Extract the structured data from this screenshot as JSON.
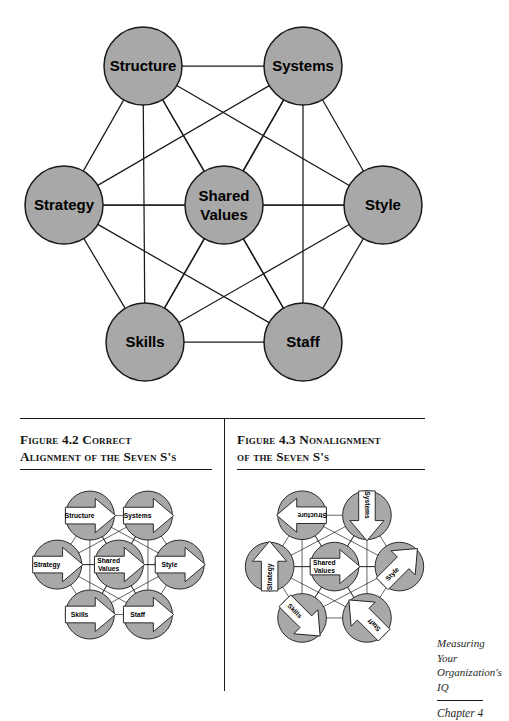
{
  "document": {
    "title": "The Seven S Framework",
    "page_background": "#ffffff"
  },
  "colors": {
    "node_fill": "#a8a8a8",
    "node_stroke": "#1a1a1a",
    "edge_stroke": "#1a1a1a",
    "arrow_fill": "#ffffff",
    "arrow_stroke": "#1a1a1a",
    "text": "#000000",
    "rule": "#1a1a1a"
  },
  "main_diagram": {
    "name": "seven-s-framework-diagram",
    "node_label_font_size": 15,
    "nodes": [
      {
        "id": "structure",
        "label": "Structure",
        "cx": 143,
        "cy": 66,
        "r": 39
      },
      {
        "id": "systems",
        "label": "Systems",
        "cx": 303,
        "cy": 66,
        "r": 39
      },
      {
        "id": "strategy",
        "label": "Strategy",
        "cx": 64,
        "cy": 205,
        "r": 39
      },
      {
        "id": "shared_values",
        "label": "Shared\nValues",
        "cx": 224,
        "cy": 205,
        "r": 39
      },
      {
        "id": "style",
        "label": "Style",
        "cx": 383,
        "cy": 205,
        "r": 39
      },
      {
        "id": "skills",
        "label": "Skills",
        "cx": 145,
        "cy": 342,
        "r": 39
      },
      {
        "id": "staff",
        "label": "Staff",
        "cx": 303,
        "cy": 342,
        "r": 39
      }
    ],
    "edges": [
      [
        "structure",
        "systems"
      ],
      [
        "structure",
        "strategy"
      ],
      [
        "structure",
        "shared_values"
      ],
      [
        "structure",
        "style"
      ],
      [
        "structure",
        "skills"
      ],
      [
        "structure",
        "staff"
      ],
      [
        "systems",
        "strategy"
      ],
      [
        "systems",
        "shared_values"
      ],
      [
        "systems",
        "style"
      ],
      [
        "systems",
        "skills"
      ],
      [
        "systems",
        "staff"
      ],
      [
        "strategy",
        "shared_values"
      ],
      [
        "strategy",
        "style"
      ],
      [
        "strategy",
        "skills"
      ],
      [
        "strategy",
        "staff"
      ],
      [
        "shared_values",
        "style"
      ],
      [
        "shared_values",
        "skills"
      ],
      [
        "shared_values",
        "staff"
      ],
      [
        "style",
        "skills"
      ],
      [
        "style",
        "staff"
      ],
      [
        "skills",
        "staff"
      ]
    ]
  },
  "figures": [
    {
      "id": "figure-4-2",
      "number": "4.2",
      "caption": "Figure 4.2 Correct\nAlignment of the Seven S's",
      "diagram": {
        "name": "correct-alignment-mini-diagram",
        "nodes": [
          {
            "id": "structure",
            "label": "Structure",
            "cx": 77,
            "cy": 38,
            "r": 27,
            "arrow_angle": 0
          },
          {
            "id": "systems",
            "label": "Systems",
            "cx": 141,
            "cy": 38,
            "r": 27,
            "arrow_angle": 0
          },
          {
            "id": "strategy",
            "label": "Strategy",
            "cx": 41,
            "cy": 92,
            "r": 27,
            "arrow_angle": 0
          },
          {
            "id": "shared_values",
            "label": "Shared\nValues",
            "cx": 109,
            "cy": 92,
            "r": 27,
            "arrow_angle": 0
          },
          {
            "id": "style",
            "label": "Style",
            "cx": 176,
            "cy": 92,
            "r": 27,
            "arrow_angle": 0
          },
          {
            "id": "skills",
            "label": "Skills",
            "cx": 77,
            "cy": 147,
            "r": 27,
            "arrow_angle": 0
          },
          {
            "id": "staff",
            "label": "Staff",
            "cx": 141,
            "cy": 147,
            "r": 27,
            "arrow_angle": 0
          }
        ]
      }
    },
    {
      "id": "figure-4-3",
      "number": "4.3",
      "caption": "Figure 4.3 Nonalignment\nof the Seven S's",
      "diagram": {
        "name": "nonalignment-mini-diagram",
        "nodes": [
          {
            "id": "structure",
            "label": "Structure",
            "cx": 72,
            "cy": 38,
            "r": 27,
            "arrow_angle": 180
          },
          {
            "id": "systems",
            "label": "Systems",
            "cx": 144,
            "cy": 38,
            "r": 27,
            "arrow_angle": 90
          },
          {
            "id": "strategy",
            "label": "Strategy",
            "cx": 36,
            "cy": 95,
            "r": 27,
            "arrow_angle": -90
          },
          {
            "id": "shared_values",
            "label": "Shared\nValues",
            "cx": 108,
            "cy": 95,
            "r": 27,
            "arrow_angle": 0
          },
          {
            "id": "style",
            "label": "Style",
            "cx": 180,
            "cy": 95,
            "r": 27,
            "arrow_angle": -45
          },
          {
            "id": "skills",
            "label": "Skills",
            "cx": 72,
            "cy": 152,
            "r": 27,
            "arrow_angle": 45
          },
          {
            "id": "staff",
            "label": "Staff",
            "cx": 144,
            "cy": 152,
            "r": 27,
            "arrow_angle": -135
          }
        ]
      }
    }
  ],
  "footer": {
    "book_title_line1": "Measuring Your",
    "book_title_line2": "Organization's",
    "book_title_line3": "IQ",
    "chapter": "Chapter 4"
  },
  "chart_data": {
    "type": "diagram",
    "nodes": [
      "Structure",
      "Systems",
      "Strategy",
      "Shared Values",
      "Style",
      "Skills",
      "Staff"
    ],
    "graph": "complete (K7) — every element connected to every other element",
    "edge_count": 21,
    "variants": [
      {
        "label": "Figure 4.2 Correct Alignment of the Seven S's",
        "arrow_directions": {
          "Structure": "right",
          "Systems": "right",
          "Strategy": "right",
          "Shared Values": "right",
          "Style": "right",
          "Skills": "right",
          "Staff": "right"
        }
      },
      {
        "label": "Figure 4.3 Nonalignment of the Seven S's",
        "arrow_directions": {
          "Structure": "left",
          "Systems": "down",
          "Strategy": "up",
          "Shared Values": "right",
          "Style": "up-right",
          "Skills": "down-right",
          "Staff": "up-left"
        }
      }
    ]
  }
}
